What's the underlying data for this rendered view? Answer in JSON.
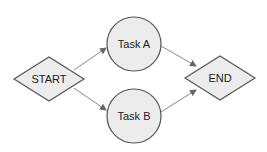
{
  "diagram": {
    "type": "flowchart",
    "nodes": [
      {
        "id": "start",
        "label": "START",
        "shape": "diamond",
        "cx": 49,
        "cy": 79
      },
      {
        "id": "task_a",
        "label": "Task A",
        "shape": "circle",
        "cx": 134,
        "cy": 44
      },
      {
        "id": "task_b",
        "label": "Task B",
        "shape": "circle",
        "cx": 134,
        "cy": 116
      },
      {
        "id": "end",
        "label": "END",
        "shape": "diamond",
        "cx": 220,
        "cy": 78
      }
    ],
    "edges": [
      {
        "from": "start",
        "to": "task_a"
      },
      {
        "from": "start",
        "to": "task_b"
      },
      {
        "from": "task_a",
        "to": "end"
      },
      {
        "from": "task_b",
        "to": "end"
      }
    ],
    "colors": {
      "fill": "#ececec",
      "stroke": "#555555",
      "edge": "#777777",
      "text": "#222222"
    }
  }
}
